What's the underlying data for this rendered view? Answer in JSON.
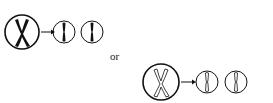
{
  "diagram": {
    "top_row": {
      "parent": "replicated chromosome (dark, X-shaped)",
      "result": [
        "single chromatid (dark)",
        "single chromatid (dark)"
      ]
    },
    "separator_label": "or",
    "bottom_row": {
      "parent": "replicated chromosome (outline, X-shaped)",
      "result": [
        "single chromatid (outline)",
        "single chromatid (outline)"
      ]
    }
  }
}
